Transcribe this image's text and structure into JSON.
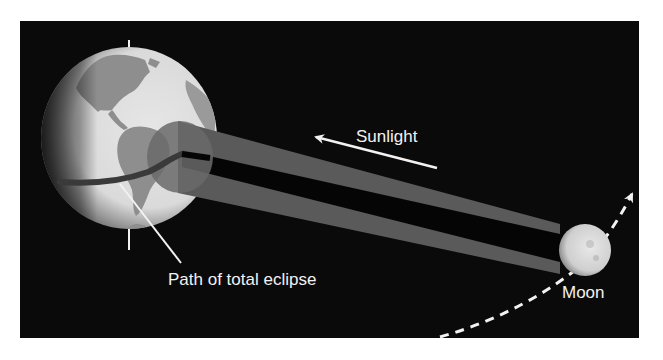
{
  "diagram": {
    "labels": {
      "sunlight": "Sunlight",
      "path": "Path of total eclipse",
      "moon": "Moon"
    },
    "colors": {
      "background": "#0a0a0a",
      "earth_ocean": "#dcdcdc",
      "earth_land": "#8e8e8e",
      "penumbra": "#5a5a5a",
      "umbra": "#050505",
      "eclipse_path": "#3a3a3a",
      "text": "#f2f2f2",
      "moon": "#d8d8d8"
    },
    "elements": [
      {
        "name": "earth",
        "type": "globe"
      },
      {
        "name": "earth-axis",
        "type": "line"
      },
      {
        "name": "penumbra-spot",
        "type": "ellipse"
      },
      {
        "name": "shadow-cone",
        "type": "cone"
      },
      {
        "name": "sunlight-arrow",
        "type": "arrow",
        "direction": "toward earth"
      },
      {
        "name": "moon",
        "type": "sphere"
      },
      {
        "name": "moon-orbit-arrow",
        "type": "dashed-arrow"
      },
      {
        "name": "path-leader-line",
        "type": "line"
      }
    ]
  }
}
